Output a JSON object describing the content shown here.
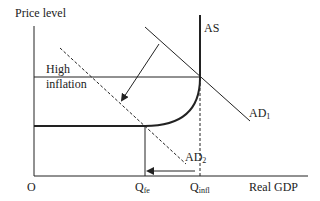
{
  "diagram": {
    "y_axis_label": "Price level",
    "x_axis_label": "Real GDP",
    "origin_label": "O",
    "curves": {
      "as": {
        "label": "AS"
      },
      "ad1": {
        "label_main": "AD",
        "label_sub": "1"
      },
      "ad2": {
        "label_main": "AD",
        "label_sub": "2",
        "style": "dashed"
      }
    },
    "annotation": {
      "line1": "High",
      "line2": "inflation"
    },
    "x_ticks": {
      "qfe": {
        "main": "Q",
        "sub": "fe"
      },
      "qinfl": {
        "main": "Q",
        "sub": "infl"
      }
    },
    "colors": {
      "line": "#222222",
      "background": "#ffffff"
    }
  }
}
